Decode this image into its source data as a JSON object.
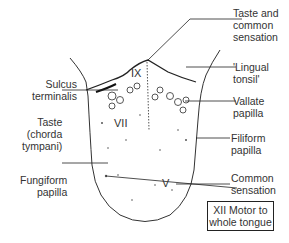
{
  "diagram": {
    "labels_left": {
      "sulcus_terminalis": [
        "Sulcus",
        "terminalis"
      ],
      "taste_chorda": [
        "Taste",
        "(chorda",
        "tympani)"
      ],
      "fungiform": [
        "Fungiform",
        "papilla"
      ]
    },
    "labels_right": {
      "taste_common": [
        "Taste and",
        "common",
        "sensation"
      ],
      "lingual_tonsil": [
        "'Lingual",
        "tonsil'"
      ],
      "vallate": [
        "Vallate",
        "papilla"
      ],
      "filiform": [
        "Filiform",
        "papilla"
      ],
      "common_sensation": [
        "Common",
        "sensation"
      ]
    },
    "regions": {
      "ix": "IX",
      "vii": "VII",
      "v": "V"
    },
    "box": [
      "XII Motor to",
      "whole tongue"
    ]
  }
}
